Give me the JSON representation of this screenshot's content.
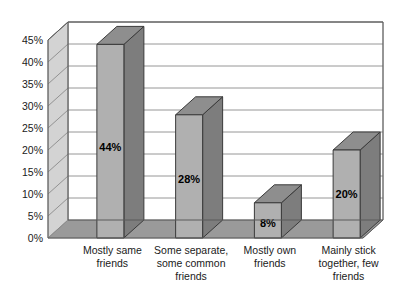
{
  "chart_data": {
    "type": "bar",
    "title": "",
    "subtitle": "",
    "xlabel": "",
    "ylabel": "",
    "categories": [
      "Mostly same friends",
      "Some separate, some common friends",
      "Mostly own friends",
      "Mainly  stick together, few friends"
    ],
    "category_lines": [
      [
        "Mostly same",
        "friends"
      ],
      [
        "Some separate,",
        "some common",
        "friends"
      ],
      [
        "Mostly own",
        "friends"
      ],
      [
        "Mainly  stick",
        "together, few",
        "friends"
      ]
    ],
    "values": [
      44,
      28,
      8,
      20
    ],
    "value_labels": [
      "44%",
      "28%",
      "8%",
      "20%"
    ],
    "ylim": [
      0,
      45
    ],
    "ytick_values": [
      0,
      5,
      10,
      15,
      20,
      25,
      30,
      35,
      40,
      45
    ],
    "ytick_labels": [
      "0%",
      "5%",
      "10%",
      "15%",
      "20%",
      "25%",
      "30%",
      "35%",
      "40%",
      "45%"
    ],
    "grid": true,
    "legend": false,
    "legend_position": "none",
    "style": "3d-column",
    "colors": {
      "bar_front": "#b0b0b0",
      "bar_top": "#8e8e8e",
      "bar_side": "#7d7d7d",
      "bar_outline": "#3a3a3a",
      "wall_back": "#ffffff",
      "wall_side": "#d3d3d3",
      "floor": "#9a9a9a",
      "gridline": "#8a8a8a",
      "text": "#1a1a1a"
    }
  }
}
